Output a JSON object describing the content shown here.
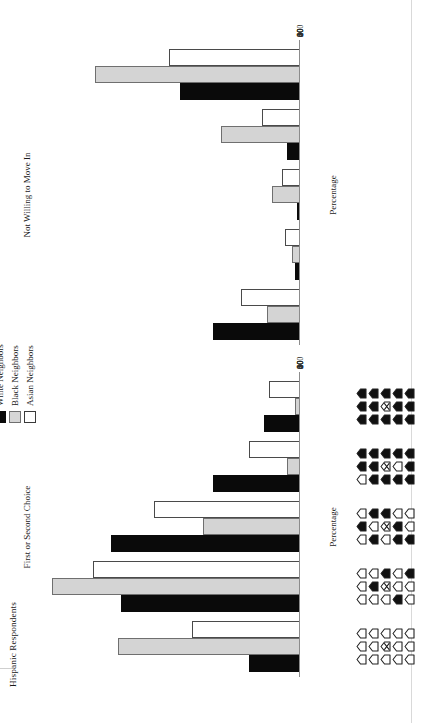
{
  "figure": {
    "title": "Hispanic Respondents",
    "legend": {
      "items": [
        {
          "label": "White Neighbors",
          "swatch": "black-filled-square",
          "color": "#0a0a0a"
        },
        {
          "label": "Black Neighbors",
          "swatch": "gray-filled-square",
          "color": "#d6d6d6"
        },
        {
          "label": "Asian Neighbors",
          "swatch": "white-open-square",
          "color": "#ffffff"
        }
      ]
    }
  },
  "chart_data": [
    {
      "type": "bar",
      "title": "First or Second Choice",
      "xlabel": "Neighborhood composition",
      "ylabel": "Percentage",
      "ylim": [
        0,
        100
      ],
      "yticks": [
        0,
        20,
        40,
        60,
        80,
        100
      ],
      "ytick_labels": [
        "0",
        "20",
        "40",
        "60",
        "80",
        "100"
      ],
      "grid": false,
      "legend_position": "top-right",
      "categories": [
        "All own-group (0 out-group)",
        "Mostly own-group (3 out-group)",
        "Half and half (7 out-group)",
        "Mostly out-group (10 out-group)",
        "All out-group (14 out-group)"
      ],
      "series": [
        {
          "name": "White Neighbors",
          "color": "#0a0a0a",
          "values": [
            20,
            70,
            74,
            34,
            14
          ]
        },
        {
          "name": "Black Neighbors",
          "color": "#d4d4d4",
          "values": [
            71,
            97,
            38,
            5,
            2
          ]
        },
        {
          "name": "Asian Neighbors",
          "color": "#ffffff",
          "values": [
            42,
            81,
            57,
            20,
            12
          ]
        }
      ]
    },
    {
      "type": "bar",
      "title": "Not Willing to Move In",
      "xlabel": "Neighborhood composition",
      "ylabel": "Percentage",
      "ylim": [
        0,
        100
      ],
      "yticks": [
        0,
        20,
        40,
        60,
        80,
        100
      ],
      "ytick_labels": [
        "0",
        "20",
        "40",
        "60",
        "80",
        "100"
      ],
      "grid": false,
      "legend_position": "top-right",
      "categories": [
        "All own-group (0 out-group)",
        "Mostly own-group (3 out-group)",
        "Half and half (7 out-group)",
        "Mostly out-group (10 out-group)",
        "All out-group (14 out-group)"
      ],
      "series": [
        {
          "name": "White Neighbors",
          "color": "#0a0a0a",
          "values": [
            34,
            2,
            1,
            5,
            47
          ]
        },
        {
          "name": "Black Neighbors",
          "color": "#d4d4d4",
          "values": [
            13,
            3,
            11,
            31,
            80
          ]
        },
        {
          "name": "Asian Neighbors",
          "color": "#ffffff",
          "values": [
            23,
            6,
            7,
            15,
            51
          ]
        }
      ]
    }
  ],
  "pictograms": {
    "note": "5 neighborhood cards, each a 5-row x 3-column grid of houses; center house of the middle row is the respondent (marked with an X). 1 = filled/out-group, 0 = open/own-group.",
    "cards": [
      {
        "label": "All own-group",
        "rows": [
          [
            0,
            0,
            0
          ],
          [
            0,
            0,
            0
          ],
          [
            0,
            "ego",
            0
          ],
          [
            0,
            0,
            0
          ],
          [
            0,
            0,
            0
          ]
        ]
      },
      {
        "label": "Mostly own-group",
        "rows": [
          [
            0,
            0,
            0
          ],
          [
            0,
            1,
            0
          ],
          [
            0,
            "ego",
            1
          ],
          [
            1,
            0,
            0
          ],
          [
            0,
            0,
            1
          ]
        ]
      },
      {
        "label": "Half and half",
        "rows": [
          [
            0,
            1,
            0
          ],
          [
            1,
            0,
            1
          ],
          [
            0,
            "ego",
            1
          ],
          [
            1,
            1,
            0
          ],
          [
            1,
            0,
            0
          ]
        ]
      },
      {
        "label": "Mostly out-group",
        "rows": [
          [
            0,
            1,
            1
          ],
          [
            1,
            1,
            1
          ],
          [
            1,
            "ego",
            1
          ],
          [
            1,
            0,
            1
          ],
          [
            1,
            1,
            1
          ]
        ]
      },
      {
        "label": "All out-group",
        "rows": [
          [
            1,
            1,
            1
          ],
          [
            1,
            1,
            1
          ],
          [
            1,
            "ego",
            1
          ],
          [
            1,
            1,
            1
          ],
          [
            1,
            1,
            1
          ]
        ]
      }
    ]
  }
}
